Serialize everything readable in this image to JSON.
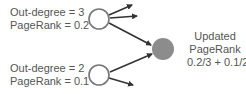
{
  "diagram": {
    "source_nodes": [
      {
        "out_degree_label": "Out-degree = 3",
        "pagerank_label": "PageRank = 0.2"
      },
      {
        "out_degree_label": "Out-degree = 2",
        "pagerank_label": "PageRank = 0.1"
      }
    ],
    "target_node": {
      "lines": [
        "Updated",
        "PageRank",
        "0.2/3 + 0.1/2"
      ]
    },
    "colors": {
      "source_node_stroke": "#777777",
      "target_node_fill": "#8c8c8c",
      "arrow": "#333333",
      "text": "#555555"
    }
  }
}
